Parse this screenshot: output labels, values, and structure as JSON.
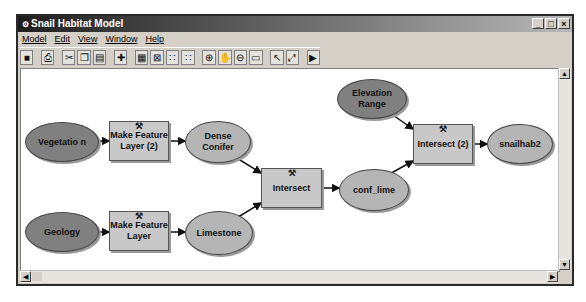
{
  "window": {
    "title": "Snail Habitat Model",
    "controls": [
      "_",
      "□",
      "×"
    ]
  },
  "menu": [
    "Model",
    "Edit",
    "View",
    "Window",
    "Help"
  ],
  "toolbar": [
    {
      "name": "save-icon",
      "glyph": "■"
    },
    {
      "name": "print-icon",
      "glyph": "⎙"
    },
    {
      "name": "cut-icon",
      "glyph": "✂"
    },
    {
      "name": "copy-icon",
      "glyph": "❐"
    },
    {
      "name": "paste-icon",
      "glyph": "▤"
    },
    {
      "name": "add-data-icon",
      "glyph": "✚"
    },
    {
      "name": "auto-layout-icon",
      "glyph": "▦"
    },
    {
      "name": "full-extent-icon",
      "glyph": "⊠"
    },
    {
      "name": "zoom-in-fixed-icon",
      "glyph": "∷"
    },
    {
      "name": "zoom-out-fixed-icon",
      "glyph": "∷"
    },
    {
      "name": "zoom-in-icon",
      "glyph": "⊕"
    },
    {
      "name": "pan-icon",
      "glyph": "✋"
    },
    {
      "name": "zoom-out-icon",
      "glyph": "⊖"
    },
    {
      "name": "display-icon",
      "glyph": "▭"
    },
    {
      "name": "select-icon",
      "glyph": "↖"
    },
    {
      "name": "connect-icon",
      "glyph": "⤢"
    },
    {
      "name": "run-icon",
      "glyph": "▶"
    }
  ],
  "nodes": {
    "vegetation": "Vegetatio n",
    "geology": "Geology",
    "make_feature_layer_2": "Make Feature Layer (2)",
    "make_feature_layer": "Make Feature Layer",
    "dense_conifer": "Dense Conifer",
    "limestone": "Limestone",
    "intersect": "Intersect",
    "conf_lime": "conf_lime",
    "elevation_range": "Elevation Range",
    "intersect_2": "Intersect (2)",
    "snailhab2": "snailhab2"
  },
  "tool_icon": "⚒",
  "colors": {
    "input_data": "#808080",
    "derived_data": "#b5b5b5",
    "tool": "#c8c8c8"
  }
}
